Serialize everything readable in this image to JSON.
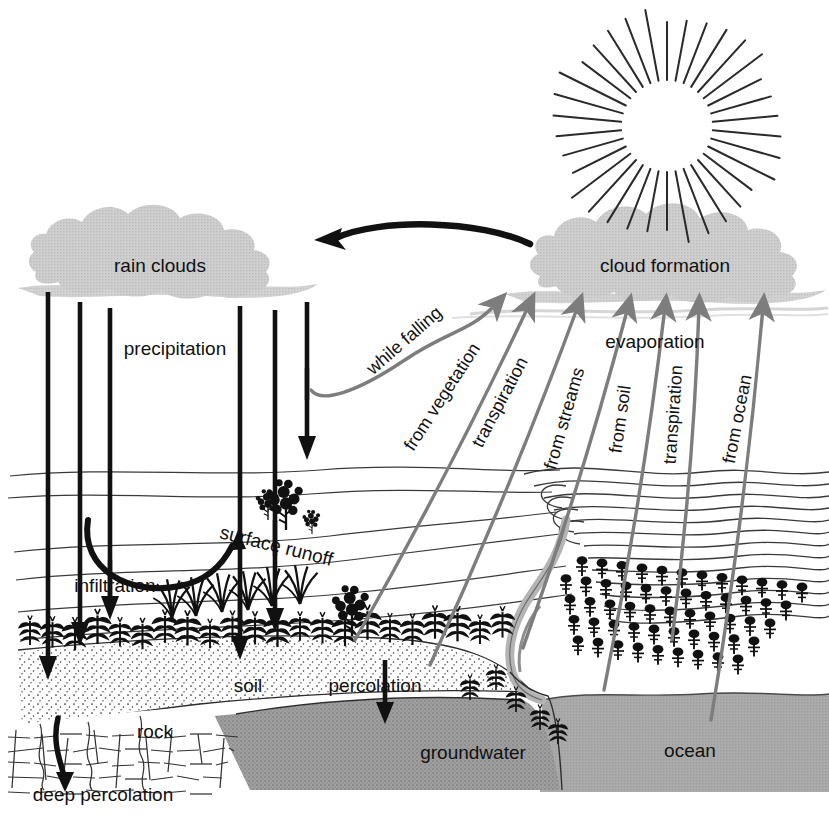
{
  "diagram": {
    "type": "process-diagram",
    "background_color": "#ffffff",
    "colors": {
      "ink": "#111111",
      "cloud_gray": "#c9c9c9",
      "haze_gray": "#d8d8d8",
      "arrow_gray": "#7d7d7d",
      "water_gray": "#a9a9a9",
      "groundwater_gray": "#9c9c9c",
      "river_gray": "#b0b0b0",
      "soil_fill": "#ffffff"
    }
  },
  "sky": {
    "sun": {
      "name": "sun",
      "ray_count": 34,
      "center_x": 667,
      "center_y": 126,
      "inner_radius": 46,
      "outer_radius": 112
    },
    "clouds": [
      {
        "id": "rain-clouds",
        "label": "rain clouds",
        "label_x": 160,
        "label_y": 272
      },
      {
        "id": "cloud-formation",
        "label": "cloud formation",
        "label_x": 665,
        "label_y": 272
      }
    ],
    "return_arrow": {
      "name": "cloud-transport-arrow",
      "direction": "right-to-left",
      "from_label": "cloud formation",
      "to_label": "rain clouds"
    }
  },
  "precipitation": {
    "label": "precipitation",
    "label_x": 175,
    "label_y": 355,
    "rain_line_count": 6,
    "rain_lines_x": [
      48,
      80,
      110,
      240,
      275,
      307
    ]
  },
  "ground_labels": [
    {
      "id": "surface-runoff",
      "text": "surface runoff",
      "x": 275,
      "y": 552,
      "rotate": 14
    },
    {
      "id": "infiltration",
      "text": "infiltration",
      "x": 115,
      "y": 592,
      "rotate": 0
    },
    {
      "id": "soil",
      "text": "soil",
      "x": 248,
      "y": 692,
      "rotate": 0
    },
    {
      "id": "percolation",
      "text": "percolation",
      "x": 375,
      "y": 692,
      "rotate": 0
    },
    {
      "id": "rock",
      "text": "rock",
      "x": 155,
      "y": 738,
      "rotate": 0
    },
    {
      "id": "groundwater",
      "text": "groundwater",
      "x": 473,
      "y": 759,
      "rotate": 0
    },
    {
      "id": "ocean",
      "text": "ocean",
      "x": 690,
      "y": 757,
      "rotate": 0
    },
    {
      "id": "deep-percolation",
      "text": "deep percolation",
      "x": 103,
      "y": 801,
      "rotate": 0
    }
  ],
  "evaporation": {
    "heading": {
      "text": "evaporation",
      "x": 655,
      "y": 348
    },
    "arrows": [
      {
        "id": "while-falling",
        "label": "while falling",
        "label_rotate": -41,
        "label_x": 408,
        "label_y": 345,
        "tail_x": 311,
        "tail_y": 390,
        "tip_x": 497,
        "tip_y": 303,
        "curved": true
      },
      {
        "id": "from-vegetation",
        "label": "from vegetation",
        "label_rotate": -57,
        "label_x": 447,
        "label_y": 400,
        "tail_x": 355,
        "tail_y": 640,
        "tip_x": 529,
        "tip_y": 305,
        "curved": false
      },
      {
        "id": "transpiration-left",
        "label": "transpiration",
        "label_rotate": -62,
        "label_x": 505,
        "label_y": 405,
        "tail_x": 430,
        "tail_y": 665,
        "tip_x": 578,
        "tip_y": 306,
        "curved": false
      },
      {
        "id": "from-streams",
        "label": "from streams",
        "label_rotate": -74,
        "label_x": 570,
        "label_y": 420,
        "tail_x": 523,
        "tail_y": 648,
        "tip_x": 628,
        "tip_y": 307,
        "curved": false
      },
      {
        "id": "from-soil",
        "label": "from soil",
        "label_rotate": -82,
        "label_x": 626,
        "label_y": 420,
        "tail_x": 604,
        "tail_y": 690,
        "tip_x": 665,
        "tip_y": 307,
        "curved": false
      },
      {
        "id": "transpiration-right",
        "label": "transpiration",
        "label_rotate": -86,
        "label_x": 679,
        "label_y": 415,
        "tail_x": 672,
        "tail_y": 640,
        "tip_x": 699,
        "tip_y": 307,
        "curved": false
      },
      {
        "id": "from-ocean",
        "label": "from ocean",
        "label_rotate": -79,
        "label_x": 743,
        "label_y": 420,
        "tail_x": 711,
        "tail_y": 720,
        "tip_x": 763,
        "tip_y": 307,
        "curved": false
      }
    ]
  },
  "landscape": {
    "layers": [
      "sky",
      "hills",
      "vegetation-row",
      "soil",
      "rock",
      "groundwater",
      "ocean"
    ],
    "features": [
      {
        "id": "corn-row",
        "name": "corn-plants",
        "count": 22
      },
      {
        "id": "grass-tufts",
        "name": "grass-tufts",
        "count": 6
      },
      {
        "id": "shrubs",
        "name": "shrubs",
        "count": 4
      },
      {
        "id": "orchard",
        "name": "orchard-trees",
        "count": 54
      },
      {
        "id": "river",
        "name": "river"
      },
      {
        "id": "contours",
        "name": "hill-contour-lines",
        "count": 13
      }
    ]
  }
}
